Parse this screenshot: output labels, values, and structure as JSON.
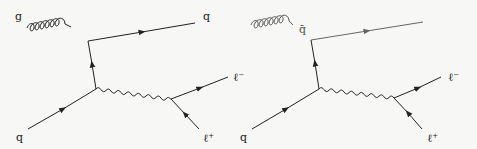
{
  "diagrams": [
    {
      "name": "qg-to-q-lepton-pair",
      "labels": {
        "gluon": "g",
        "outgoing_quark": "q",
        "incoming_quark": "q",
        "lepton_minus": "ℓ",
        "lepton_minus_sup": "−",
        "lepton_plus": "ℓ",
        "lepton_plus_sup": "+"
      },
      "line_color": "#222222"
    },
    {
      "name": "qqbar-to-g-lepton-pair",
      "labels": {
        "antiquark": "q̄",
        "incoming_quark": "q",
        "lepton_minus": "ℓ",
        "lepton_minus_sup": "−",
        "lepton_plus": "ℓ",
        "lepton_plus_sup": "+"
      },
      "gluon_color": "#555555",
      "outgoing_line_color": "#666666",
      "line_color": "#222222"
    }
  ]
}
